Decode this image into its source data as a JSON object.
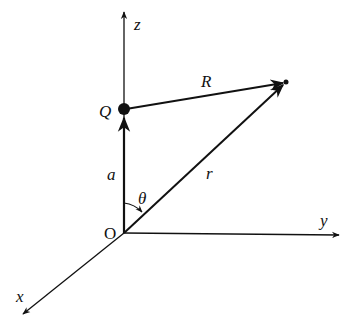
{
  "diagram": {
    "axes": {
      "z_label": "z",
      "y_label": "y",
      "x_label": "x",
      "origin_label": "O"
    },
    "charge_label": "Q",
    "vectors": {
      "a_label": "a",
      "R_label": "R",
      "r_label": "r"
    },
    "angle_label": "θ",
    "colors": {
      "stroke": "#111111",
      "background": "#ffffff"
    }
  }
}
